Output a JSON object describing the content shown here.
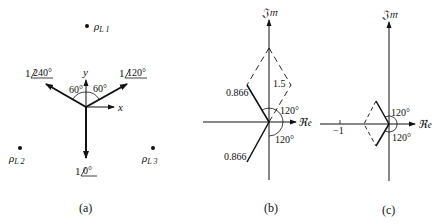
{
  "panel_a": {
    "caption": "(a)",
    "charge_labels": [
      "ρ",
      "L 1",
      "L 2",
      "L 3"
    ],
    "rho": "ρ",
    "sub1": "L 1",
    "sub2": "L 2",
    "sub3": "L 3",
    "phasor_240": {
      "mag": "1",
      "angle": "240°"
    },
    "phasor_120": {
      "mag": "1",
      "angle": "120°"
    },
    "phasor_0": {
      "mag": "1",
      "angle": "0°"
    },
    "axis_x": "x",
    "axis_y": "y",
    "angle_left": "60°",
    "angle_right": "60°"
  },
  "panel_b": {
    "caption": "(b)",
    "im_label": "𝔍𝔪",
    "re_label": "ℜ𝔢",
    "mag_upper": "0.866",
    "mag_lower": "0.866",
    "resultant": "1.5",
    "angle_upper": "120°",
    "angle_lower": "120°"
  },
  "panel_c": {
    "caption": "(c)",
    "im_label": "𝔍𝔪",
    "re_label": "ℜ𝔢",
    "tick_label": "−1",
    "angle_upper": "120°",
    "angle_lower": "120°"
  }
}
